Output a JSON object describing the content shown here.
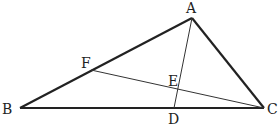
{
  "diagram": {
    "type": "triangle-cevians",
    "points": {
      "A": {
        "label": "A",
        "x": 192,
        "y": 18
      },
      "B": {
        "label": "B",
        "x": 20,
        "y": 108
      },
      "C": {
        "label": "C",
        "x": 264,
        "y": 108
      },
      "D": {
        "label": "D",
        "x": 174,
        "y": 108
      },
      "E": {
        "label": "E",
        "x": 178,
        "y": 89
      },
      "F": {
        "label": "F",
        "x": 91,
        "y": 70
      }
    },
    "segments": [
      {
        "from": "A",
        "to": "B",
        "weight": "bold"
      },
      {
        "from": "B",
        "to": "C",
        "weight": "bold"
      },
      {
        "from": "C",
        "to": "A",
        "weight": "bold"
      },
      {
        "from": "A",
        "to": "D",
        "weight": "thin"
      },
      {
        "from": "F",
        "to": "C",
        "weight": "thin"
      }
    ],
    "colors": {
      "stroke": "#222222",
      "background": "#ffffff"
    }
  }
}
